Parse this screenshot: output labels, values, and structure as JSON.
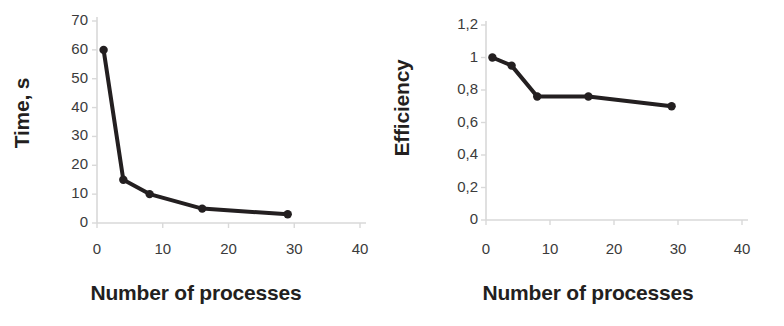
{
  "figure": {
    "background": "#ffffff",
    "series_color": "#231f20",
    "axis_color": "#d9d9d9"
  },
  "chart_data": [
    {
      "type": "line",
      "title": "",
      "xlabel": "Number of processes",
      "ylabel": "Time, s",
      "x": [
        1,
        4,
        8,
        16,
        29
      ],
      "values": [
        60,
        15,
        10,
        5,
        3
      ],
      "series": [
        {
          "name": "Time, s",
          "values": [
            60,
            15,
            10,
            5,
            3
          ]
        }
      ],
      "xlim": [
        0,
        40
      ],
      "ylim": [
        0,
        70
      ],
      "xticks": [
        0,
        10,
        20,
        30,
        40
      ],
      "yticks": [
        0,
        10,
        20,
        30,
        40,
        50,
        60,
        70
      ],
      "xticklabels": [
        "0",
        "10",
        "20",
        "30",
        "40"
      ],
      "yticklabels": [
        "0",
        "10",
        "20",
        "30",
        "40",
        "50",
        "60",
        "70"
      ],
      "grid": false,
      "legend": "none",
      "marker": "circle",
      "line_color": "#231f20"
    },
    {
      "type": "line",
      "title": "",
      "xlabel": "Number of processes",
      "ylabel": "Efficiency",
      "x": [
        1,
        4,
        8,
        16,
        29
      ],
      "values": [
        1,
        0.95,
        0.76,
        0.76,
        0.7
      ],
      "series": [
        {
          "name": "Efficiency",
          "values": [
            1,
            0.95,
            0.76,
            0.76,
            0.7
          ]
        }
      ],
      "xlim": [
        0,
        40
      ],
      "ylim": [
        0,
        1.2
      ],
      "xticks": [
        0,
        10,
        20,
        30,
        40
      ],
      "yticks": [
        0,
        0.2,
        0.4,
        0.6,
        0.8,
        1,
        1.2
      ],
      "xticklabels": [
        "0",
        "10",
        "20",
        "30",
        "40"
      ],
      "yticklabels": [
        "0",
        "0,2",
        "0,4",
        "0,6",
        "0,8",
        "1",
        "1,2"
      ],
      "grid": false,
      "legend": "none",
      "marker": "circle",
      "line_color": "#231f20"
    }
  ]
}
